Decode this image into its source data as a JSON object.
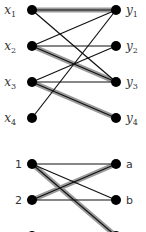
{
  "graph_top": {
    "left_nodes": [
      {
        "id": "x1",
        "label": "x",
        "sub": "1",
        "x": 32,
        "y": 10
      },
      {
        "id": "x2",
        "label": "x",
        "sub": "2",
        "x": 32,
        "y": 46
      },
      {
        "id": "x3",
        "label": "x",
        "sub": "3",
        "x": 32,
        "y": 82
      },
      {
        "id": "x4",
        "label": "x",
        "sub": "4",
        "x": 32,
        "y": 118
      }
    ],
    "right_nodes": [
      {
        "id": "y1",
        "label": "y",
        "sub": "1",
        "x": 116,
        "y": 10
      },
      {
        "id": "y2",
        "label": "y",
        "sub": "2",
        "x": 116,
        "y": 46
      },
      {
        "id": "y3",
        "label": "y",
        "sub": "3",
        "x": 116,
        "y": 82
      },
      {
        "id": "y4",
        "label": "y",
        "sub": "4",
        "x": 116,
        "y": 118
      }
    ],
    "edges": [
      {
        "from": "x1",
        "to": "y1",
        "matched": true
      },
      {
        "from": "x1",
        "to": "y3",
        "matched": false
      },
      {
        "from": "x2",
        "to": "y1",
        "matched": false
      },
      {
        "from": "x2",
        "to": "y2",
        "matched": false
      },
      {
        "from": "x2",
        "to": "y3",
        "matched": true
      },
      {
        "from": "x3",
        "to": "y2",
        "matched": false
      },
      {
        "from": "x3",
        "to": "y3",
        "matched": false
      },
      {
        "from": "x3",
        "to": "y4",
        "matched": true
      },
      {
        "from": "x4",
        "to": "y1",
        "matched": false
      }
    ]
  },
  "graph_bottom": {
    "left_nodes": [
      {
        "id": "1",
        "label": "1",
        "x": 32,
        "y": 164
      },
      {
        "id": "2",
        "label": "2",
        "x": 32,
        "y": 200
      },
      {
        "id": "3",
        "label": "3",
        "x": 32,
        "y": 236
      }
    ],
    "right_nodes": [
      {
        "id": "a",
        "label": "a",
        "x": 116,
        "y": 164
      },
      {
        "id": "b",
        "label": "b",
        "x": 116,
        "y": 200
      },
      {
        "id": "c",
        "label": "c",
        "x": 116,
        "y": 236
      }
    ],
    "edges": [
      {
        "from": "1",
        "to": "a",
        "matched": false
      },
      {
        "from": "1",
        "to": "b",
        "matched": false
      },
      {
        "from": "1",
        "to": "c",
        "matched": true
      },
      {
        "from": "2",
        "to": "a",
        "matched": true
      },
      {
        "from": "2",
        "to": "b",
        "matched": false
      }
    ]
  },
  "colors": {
    "node": "#000000",
    "edge": "#111111",
    "highlight": "#9a9a9a"
  }
}
